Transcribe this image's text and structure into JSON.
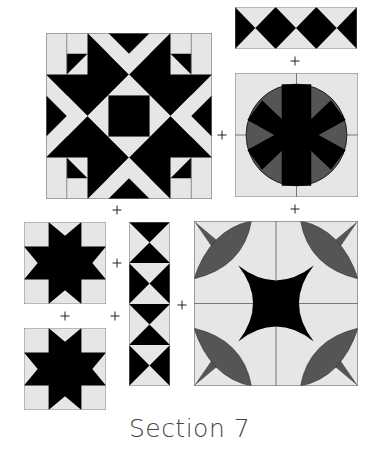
{
  "title": "Section 7",
  "colors": {
    "background": "#e6e6e6",
    "dark": "#000000",
    "medium": "#555555",
    "outline": "#777777",
    "text": "#444444"
  },
  "blocks": [
    {
      "id": "star-square-block",
      "pattern": "star with center square",
      "x": 46,
      "y": 33,
      "w": 166,
      "h": 166
    },
    {
      "id": "diamond-strip-horizontal",
      "pattern": "diamond strip (3 diamonds)",
      "x": 235,
      "y": 7,
      "w": 122,
      "h": 42
    },
    {
      "id": "circle-block",
      "pattern": "circle with radiating spokes",
      "x": 235,
      "y": 73,
      "w": 123,
      "h": 124
    },
    {
      "id": "eight-point-star-top",
      "pattern": "eight-point star",
      "x": 24,
      "y": 222,
      "w": 82,
      "h": 82
    },
    {
      "id": "hourglass-strip-vertical",
      "pattern": "hourglass strip (4 units)",
      "x": 129,
      "y": 222,
      "w": 41,
      "h": 164
    },
    {
      "id": "eight-point-star-bottom",
      "pattern": "eight-point star",
      "x": 24,
      "y": 328,
      "w": 82,
      "h": 82
    },
    {
      "id": "curved-cross-block",
      "pattern": "curved star with petals",
      "x": 194,
      "y": 221,
      "w": 164,
      "h": 165
    }
  ],
  "plus_signs": [
    {
      "x": 295,
      "y": 61
    },
    {
      "x": 222,
      "y": 135
    },
    {
      "x": 117,
      "y": 210
    },
    {
      "x": 295,
      "y": 209
    },
    {
      "x": 117,
      "y": 263
    },
    {
      "x": 65,
      "y": 316
    },
    {
      "x": 115,
      "y": 316
    },
    {
      "x": 182,
      "y": 305
    }
  ]
}
